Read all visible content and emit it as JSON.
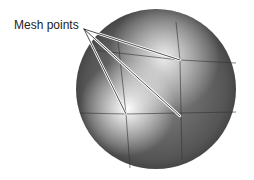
{
  "diagram": {
    "label": "Mesh points",
    "sphere": {
      "cx": 156,
      "cy": 89,
      "r": 80
    },
    "callout_origin": {
      "x": 84,
      "y": 29
    },
    "mesh_points": [
      {
        "x": 180,
        "y": 60
      },
      {
        "x": 126,
        "y": 114
      },
      {
        "x": 180,
        "y": 116
      }
    ],
    "colors": {
      "highlight": "#ffffff",
      "shadow": "#3a3a3a",
      "line": "#222222"
    }
  }
}
